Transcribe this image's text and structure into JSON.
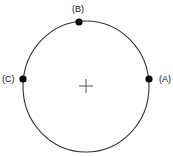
{
  "diagram": {
    "circle": {
      "cx": 86,
      "cy": 86.5,
      "rx": 63,
      "ry": 65.5,
      "stroke": "#333333"
    },
    "center_marker": {
      "x": 86,
      "y": 86,
      "arm": 7,
      "color": "#444444"
    },
    "points": [
      {
        "id": "A",
        "label": "(A)",
        "x": 149,
        "y": 79
      },
      {
        "id": "B",
        "label": "(B)",
        "x": 79,
        "y": 22
      },
      {
        "id": "C",
        "label": "(C)",
        "x": 23,
        "y": 79
      }
    ],
    "dot_color": "#000000"
  }
}
